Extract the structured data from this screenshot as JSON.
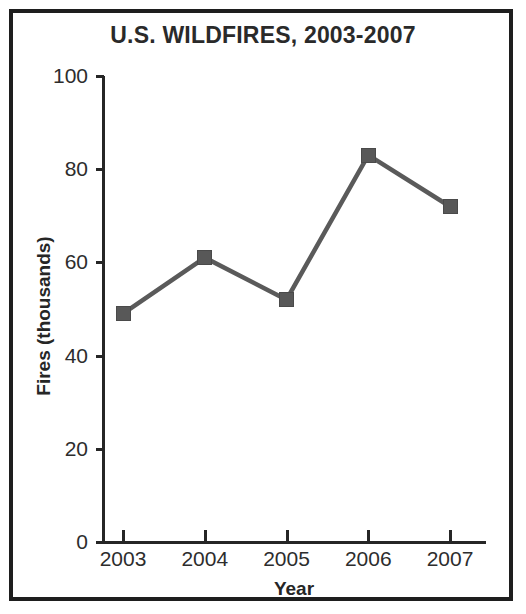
{
  "chart_data": {
    "type": "line",
    "title": "U.S. WILDFIRES, 2003-2007",
    "xlabel": "Year",
    "ylabel": "Fires (thousands)",
    "categories": [
      "2003",
      "2004",
      "2005",
      "2006",
      "2007"
    ],
    "values": [
      49,
      61,
      52,
      83,
      72
    ],
    "series": [
      {
        "name": "Fires (thousands)",
        "values": [
          49,
          61,
          52,
          83,
          72
        ]
      }
    ],
    "xlim": [
      2002.5,
      2007.5
    ],
    "ylim": [
      0,
      100
    ],
    "ytick_labels": [
      "0",
      "20",
      "40",
      "60",
      "80",
      "100"
    ],
    "ytick_values": [
      0,
      20,
      40,
      60,
      80,
      100
    ],
    "xtick_labels": [
      "2003",
      "2004",
      "2005",
      "2006",
      "2007"
    ],
    "grid": false,
    "legend": false,
    "legend_position": "none",
    "marker": "square",
    "line_color": "#5a5a5a",
    "marker_color": "#585858",
    "axis_color": "#262626",
    "frame_color": "#1e1e1e",
    "background_color": "#ffffff",
    "annotations": []
  }
}
